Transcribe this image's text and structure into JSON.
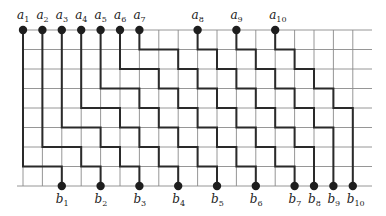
{
  "figure": {
    "type": "lattice-path-diagram",
    "grid": {
      "columns": 18,
      "rows": 9,
      "origin_x": 23,
      "origin_y": 30,
      "cell_w": 19.4,
      "cell_h": 19.5,
      "right_edge_x": 372
    },
    "colors": {
      "grid": "#8a8a8a",
      "path": "#2a2a2a",
      "node": "#1e1e1e",
      "text": "#222222"
    },
    "sources": [
      {
        "label": "a",
        "sub": "1",
        "col": 0
      },
      {
        "label": "a",
        "sub": "2",
        "col": 1
      },
      {
        "label": "a",
        "sub": "3",
        "col": 2
      },
      {
        "label": "a",
        "sub": "4",
        "col": 3
      },
      {
        "label": "a",
        "sub": "5",
        "col": 4
      },
      {
        "label": "a",
        "sub": "6",
        "col": 5
      },
      {
        "label": "a",
        "sub": "7",
        "col": 6
      },
      {
        "label": "a",
        "sub": "8",
        "col": 9
      },
      {
        "label": "a",
        "sub": "9",
        "col": 11
      },
      {
        "label": "a",
        "sub": "10",
        "col": 13
      }
    ],
    "sinks": [
      {
        "label": "b",
        "sub": "1",
        "col": 2
      },
      {
        "label": "b",
        "sub": "2",
        "col": 4
      },
      {
        "label": "b",
        "sub": "3",
        "col": 6
      },
      {
        "label": "b",
        "sub": "4",
        "col": 8
      },
      {
        "label": "b",
        "sub": "5",
        "col": 10
      },
      {
        "label": "b",
        "sub": "6",
        "col": 12
      },
      {
        "label": "b",
        "sub": "7",
        "col": 14
      },
      {
        "label": "b",
        "sub": "8",
        "col": 15
      },
      {
        "label": "b",
        "sub": "9",
        "col": 16
      },
      {
        "label": "b",
        "sub": "10",
        "col": 17
      }
    ],
    "paths": [
      {
        "from": "a1",
        "to": "b1",
        "points": [
          [
            0,
            0
          ],
          [
            0,
            7
          ],
          [
            2,
            7
          ],
          [
            2,
            8
          ]
        ]
      },
      {
        "from": "a2",
        "to": "b2",
        "points": [
          [
            1,
            0
          ],
          [
            1,
            6
          ],
          [
            3,
            6
          ],
          [
            3,
            7
          ],
          [
            4,
            7
          ],
          [
            4,
            8
          ]
        ]
      },
      {
        "from": "a3",
        "to": "b3",
        "points": [
          [
            2,
            0
          ],
          [
            2,
            5
          ],
          [
            4,
            5
          ],
          [
            4,
            6
          ],
          [
            5,
            6
          ],
          [
            5,
            7
          ],
          [
            6,
            7
          ],
          [
            6,
            8
          ]
        ]
      },
      {
        "from": "a4",
        "to": "b4",
        "points": [
          [
            3,
            0
          ],
          [
            3,
            4
          ],
          [
            5,
            4
          ],
          [
            5,
            5
          ],
          [
            6,
            5
          ],
          [
            6,
            6
          ],
          [
            7,
            6
          ],
          [
            7,
            7
          ],
          [
            8,
            7
          ],
          [
            8,
            8
          ]
        ]
      },
      {
        "from": "a5",
        "to": "b5",
        "points": [
          [
            4,
            0
          ],
          [
            4,
            3
          ],
          [
            6,
            3
          ],
          [
            6,
            4
          ],
          [
            7,
            4
          ],
          [
            7,
            5
          ],
          [
            8,
            5
          ],
          [
            8,
            6
          ],
          [
            9,
            6
          ],
          [
            9,
            7
          ],
          [
            10,
            7
          ],
          [
            10,
            8
          ]
        ]
      },
      {
        "from": "a6",
        "to": "b6",
        "points": [
          [
            5,
            0
          ],
          [
            5,
            2
          ],
          [
            7,
            2
          ],
          [
            7,
            3
          ],
          [
            8,
            3
          ],
          [
            8,
            4
          ],
          [
            9,
            4
          ],
          [
            9,
            5
          ],
          [
            10,
            5
          ],
          [
            10,
            6
          ],
          [
            11,
            6
          ],
          [
            11,
            7
          ],
          [
            12,
            7
          ],
          [
            12,
            8
          ]
        ]
      },
      {
        "from": "a7",
        "to": "b7",
        "points": [
          [
            6,
            0
          ],
          [
            6,
            1
          ],
          [
            8,
            1
          ],
          [
            8,
            2
          ],
          [
            9,
            2
          ],
          [
            9,
            3
          ],
          [
            10,
            3
          ],
          [
            10,
            4
          ],
          [
            11,
            4
          ],
          [
            11,
            5
          ],
          [
            12,
            5
          ],
          [
            12,
            6
          ],
          [
            13,
            6
          ],
          [
            13,
            7
          ],
          [
            14,
            7
          ],
          [
            14,
            8
          ]
        ]
      },
      {
        "from": "a8",
        "to": "b8",
        "points": [
          [
            9,
            0
          ],
          [
            9,
            1
          ],
          [
            10,
            1
          ],
          [
            10,
            2
          ],
          [
            11,
            2
          ],
          [
            11,
            3
          ],
          [
            12,
            3
          ],
          [
            12,
            4
          ],
          [
            13,
            4
          ],
          [
            13,
            5
          ],
          [
            14,
            5
          ],
          [
            14,
            6
          ],
          [
            15,
            6
          ],
          [
            15,
            8
          ]
        ]
      },
      {
        "from": "a9",
        "to": "b9",
        "points": [
          [
            11,
            0
          ],
          [
            11,
            1
          ],
          [
            12,
            1
          ],
          [
            12,
            2
          ],
          [
            13,
            2
          ],
          [
            13,
            3
          ],
          [
            14,
            3
          ],
          [
            14,
            4
          ],
          [
            15,
            4
          ],
          [
            15,
            5
          ],
          [
            16,
            5
          ],
          [
            16,
            8
          ]
        ]
      },
      {
        "from": "a10",
        "to": "b10",
        "points": [
          [
            13,
            0
          ],
          [
            13,
            1
          ],
          [
            14,
            1
          ],
          [
            14,
            2
          ],
          [
            15,
            2
          ],
          [
            15,
            3
          ],
          [
            16,
            3
          ],
          [
            16,
            4
          ],
          [
            17,
            4
          ],
          [
            17,
            8
          ]
        ]
      }
    ]
  }
}
